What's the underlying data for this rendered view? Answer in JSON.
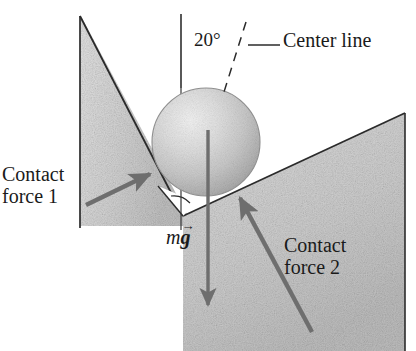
{
  "figure": {
    "name": "sphere-in-v-groove-free-body-diagram",
    "labels": {
      "contact_force_1_line1": "Contact",
      "contact_force_1_line2": "force 1",
      "contact_force_2_line1": "Contact",
      "contact_force_2_line2": "force 2",
      "center_line": "Center line",
      "angle": "20°",
      "weight_m": "m",
      "weight_g": "g",
      "weight_arrow": "→"
    },
    "colors": {
      "ink": "#1a1a1a",
      "arrow": "#6e6e6e",
      "wall_fill_light": "#d9d9d9",
      "wall_fill_dark": "#c4c4c4",
      "sphere_light": "#ededed",
      "sphere_mid": "#cfcfcf",
      "sphere_dark": "#9e9e9e",
      "background": "#ffffff"
    },
    "geometry": {
      "sphere_center_x": 206,
      "sphere_center_y": 142,
      "sphere_radius": 54,
      "v_apex_x": 183,
      "v_apex_y": 216,
      "center_line_top_y": 14,
      "angle_degrees": 20
    }
  }
}
